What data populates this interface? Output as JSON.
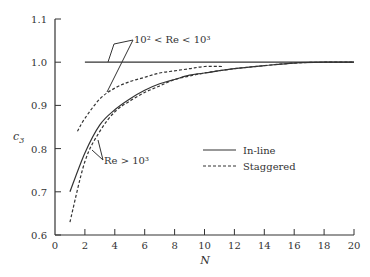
{
  "chart_data": {
    "type": "line",
    "title": "",
    "xlabel": "N",
    "ylabel": "c3",
    "xlim": [
      0,
      20
    ],
    "ylim": [
      0.6,
      1.1
    ],
    "xticks": [
      0,
      2,
      4,
      6,
      8,
      10,
      12,
      14,
      16,
      18,
      20
    ],
    "yticks": [
      0.6,
      0.7,
      0.8,
      0.9,
      1.0,
      1.1
    ],
    "xtick_labels": [
      "0",
      "2",
      "4",
      "6",
      "8",
      "10",
      "12",
      "14",
      "16",
      "18",
      "20"
    ],
    "ytick_labels": [
      "0.6",
      "0.7",
      "0.8",
      "0.9",
      "1.0",
      "1.1"
    ],
    "grid": false,
    "legend": {
      "position": "center-right",
      "entries": [
        {
          "label": "In-line",
          "style": "solid"
        },
        {
          "label": "Staggered",
          "style": "dashed"
        }
      ]
    },
    "series": [
      {
        "name": "In-line, 10^2 < Re < 10^3",
        "style": "solid",
        "x": [
          2,
          4,
          6,
          8,
          10,
          12,
          14,
          16,
          18,
          20
        ],
        "y": [
          1.0,
          1.0,
          1.0,
          1.0,
          1.0,
          1.0,
          1.0,
          1.0,
          1.0,
          1.0
        ]
      },
      {
        "name": "Staggered, 10^2 < Re < 10^3",
        "style": "dashed",
        "x": [
          1.5,
          2,
          3,
          4,
          5,
          6,
          7,
          8,
          9,
          10,
          11.2
        ],
        "y": [
          0.84,
          0.87,
          0.915,
          0.94,
          0.955,
          0.965,
          0.975,
          0.98,
          0.985,
          0.99,
          0.99
        ]
      },
      {
        "name": "In-line, Re > 10^3",
        "style": "solid",
        "x": [
          1,
          2,
          3,
          4,
          5,
          6,
          7,
          8,
          9,
          10,
          12,
          14,
          16,
          18,
          20
        ],
        "y": [
          0.7,
          0.79,
          0.855,
          0.89,
          0.915,
          0.935,
          0.95,
          0.96,
          0.97,
          0.975,
          0.985,
          0.992,
          0.998,
          1.0,
          1.0
        ]
      },
      {
        "name": "Staggered, Re > 10^3",
        "style": "dashed",
        "x": [
          1,
          2,
          3,
          4,
          5,
          6,
          7,
          8,
          9,
          10,
          12,
          14,
          16,
          18,
          20
        ],
        "y": [
          0.63,
          0.77,
          0.84,
          0.885,
          0.91,
          0.93,
          0.945,
          0.96,
          0.968,
          0.975,
          0.985,
          0.992,
          0.998,
          1.0,
          1.0
        ]
      }
    ],
    "annotations": [
      {
        "text": "10² < Re < 10³",
        "points_to": [
          "In-line, 10^2 < Re < 10^3",
          "Staggered, 10^2 < Re < 10^3"
        ]
      },
      {
        "text": "Re > 10³",
        "points_to": [
          "In-line, Re > 10^3",
          "Staggered, Re > 10^3"
        ]
      }
    ]
  },
  "labels": {
    "xlabel": "N",
    "ylabel_base": "c",
    "ylabel_sub": "3",
    "legend_inline": "In-line",
    "legend_staggered": "Staggered",
    "annot_low_re": "10² < Re < 10³",
    "annot_high_re": "Re > 10³"
  },
  "colors": {
    "line": "#333333",
    "axis": "#333333",
    "background": "#ffffff"
  }
}
